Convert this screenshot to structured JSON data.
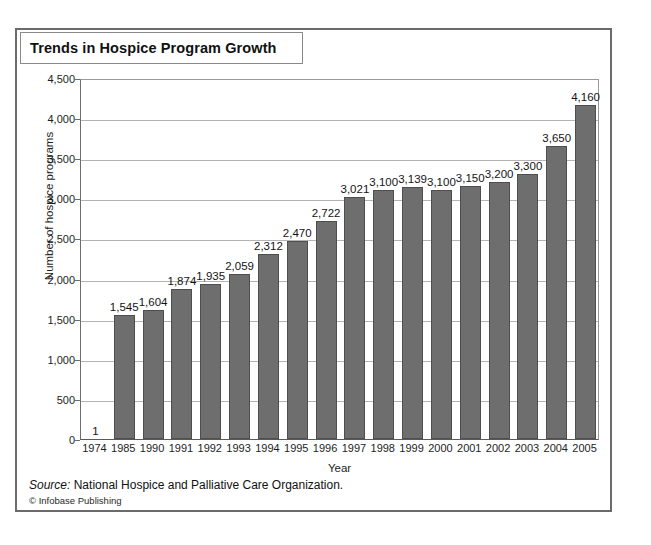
{
  "figure": {
    "title": "Trends in Hospice Program Growth",
    "source_label": "Source:",
    "source_text": "National Hospice and Palliative Care Organization.",
    "copyright": "© Infobase Publishing"
  },
  "chart_data": {
    "type": "bar",
    "title": "Trends in Hospice Program Growth",
    "xlabel": "Year",
    "ylabel": "Number of hospice programs",
    "categories": [
      "1974",
      "1985",
      "1990",
      "1991",
      "1992",
      "1993",
      "1994",
      "1995",
      "1996",
      "1997",
      "1998",
      "1999",
      "2000",
      "2001",
      "2002",
      "2003",
      "2004",
      "2005"
    ],
    "values": [
      1,
      1545,
      1604,
      1874,
      1935,
      2059,
      2312,
      2470,
      2722,
      3021,
      3100,
      3139,
      3100,
      3150,
      3200,
      3300,
      3650,
      4160
    ],
    "value_labels": [
      "1",
      "1,545",
      "1,604",
      "1,874",
      "1,935",
      "2,059",
      "2,312",
      "2,470",
      "2,722",
      "3,021",
      "3,100",
      "3,139",
      "3,100",
      "3,150",
      "3,200",
      "3,300",
      "3,650",
      "4,160"
    ],
    "ylim": [
      0,
      4500
    ],
    "ytick_values": [
      0,
      500,
      1000,
      1500,
      2000,
      2500,
      3000,
      3500,
      4000,
      4500
    ],
    "ytick_labels": [
      "0",
      "500",
      "1,000",
      "1,500",
      "2,000",
      "2,500",
      "3,000",
      "3,500",
      "4,000",
      "4,500"
    ],
    "grid": true,
    "legend": false,
    "bar_color": "#6e6e6e",
    "bar_edge_color": "#4e4e4e",
    "gridline_color": "#b4b4b4"
  }
}
